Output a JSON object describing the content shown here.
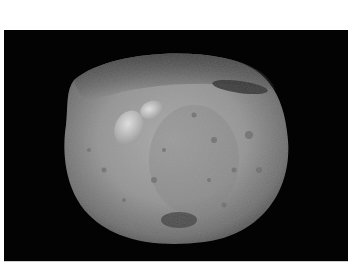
{
  "image": {
    "subject": "asteroid",
    "description": "Grayscale photograph of a large cratered asteroid against a black space background",
    "colors": {
      "page_background": "#ffffff",
      "space_background": "#030303",
      "surface_light": "#b5b5b5",
      "surface_mid": "#8a8a8a",
      "surface_dark": "#3a3a3a"
    },
    "features": [
      "bright elongated double-crater ridge upper-left",
      "dark shadowed band upper-right",
      "rough darker terrain along top edge",
      "dark crater area near bottom center",
      "scattered small craters across surface"
    ]
  }
}
